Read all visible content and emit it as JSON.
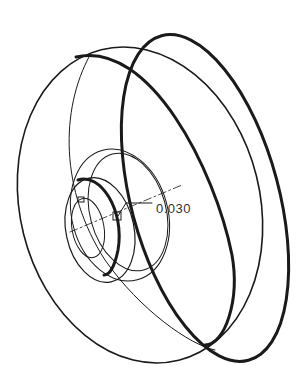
{
  "drawing": {
    "type": "isometric pulley / wheel line drawing",
    "annotation": {
      "label": "0.030",
      "leader_target": "hub shoulder edge"
    },
    "stroke_color": "#1a1a1a",
    "background": "#ffffff"
  }
}
